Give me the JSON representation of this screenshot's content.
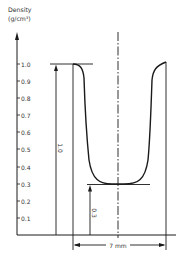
{
  "diagram": {
    "title_line1": "Density",
    "title_line2": "(g/cm³)",
    "y_ticks": [
      "1.0",
      "0.9",
      "0.8",
      "0.7",
      "0.6",
      "0.5",
      "0.4",
      "0.3",
      "0.2",
      "0.1"
    ],
    "dimension_full_density": "1.0",
    "dimension_min_density": "0.3",
    "dimension_width": "7 mm",
    "colors": {
      "stroke": "#1a1a1a",
      "text": "#333333",
      "background": "#ffffff"
    }
  }
}
